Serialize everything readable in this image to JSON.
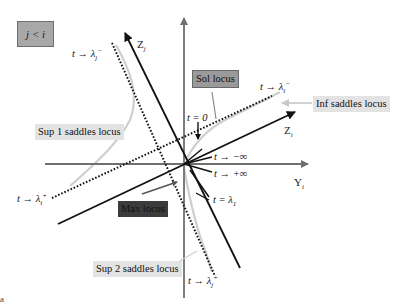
{
  "condition_label": "j < i",
  "axes": {
    "z_j": {
      "base": "Z",
      "sub": "j"
    },
    "z_i": {
      "base": "Z",
      "sub": "i"
    },
    "y_i": {
      "base": "Y",
      "sub": "i"
    }
  },
  "loci_labels": {
    "sol": "Sol locus",
    "inf_saddles": "Inf saddles locus",
    "sup1_saddles": "Sup 1 saddles locus",
    "max": "Max locus",
    "sup2_saddles": "Sup 2 saddles locus"
  },
  "limit_labels": {
    "lambda_j_minus": {
      "prefix": "t → λ",
      "sub": "j",
      "sup": "−"
    },
    "lambda_i_minus": {
      "prefix": "t → λ",
      "sub": "i",
      "sup": "−"
    },
    "lambda_i_plus": {
      "prefix": "t → λ",
      "sub": "i",
      "sup": "+"
    },
    "lambda_j_plus": {
      "prefix": "t → λ",
      "sub": "j",
      "sup": "+"
    },
    "t_zero": "t = 0",
    "t_minus_inf": "t → −∞",
    "t_plus_inf": "t → +∞",
    "t_lambda1": {
      "prefix": "t = λ",
      "sub": "1"
    }
  },
  "colors": {
    "axis_gray": "#6f6f6f",
    "line_black": "#111111",
    "locus_light": "#cfcfcf",
    "label_light_bg": "#e3e3e3",
    "label_mid_bg": "#9a9a9a",
    "label_dark_bg": "#3c3c3c",
    "condition_bg": "#a8a8a8"
  },
  "corner_mark": "a"
}
